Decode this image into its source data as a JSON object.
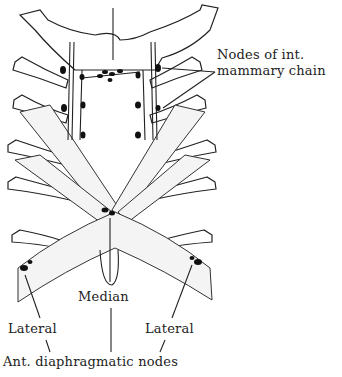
{
  "figure": {
    "type": "anatomical illustration"
  },
  "labels": {
    "internal_mammary": "Nodes of int.",
    "internal_mammary_2": "mammary chain",
    "median": "Median",
    "lateral_left": "Lateral",
    "lateral_right": "Lateral",
    "ant_diaphragmatic": "Ant. diaphragmatic nodes"
  },
  "colors": {
    "ink": "#222222",
    "background": "#ffffff",
    "node_fill": "#111111"
  }
}
